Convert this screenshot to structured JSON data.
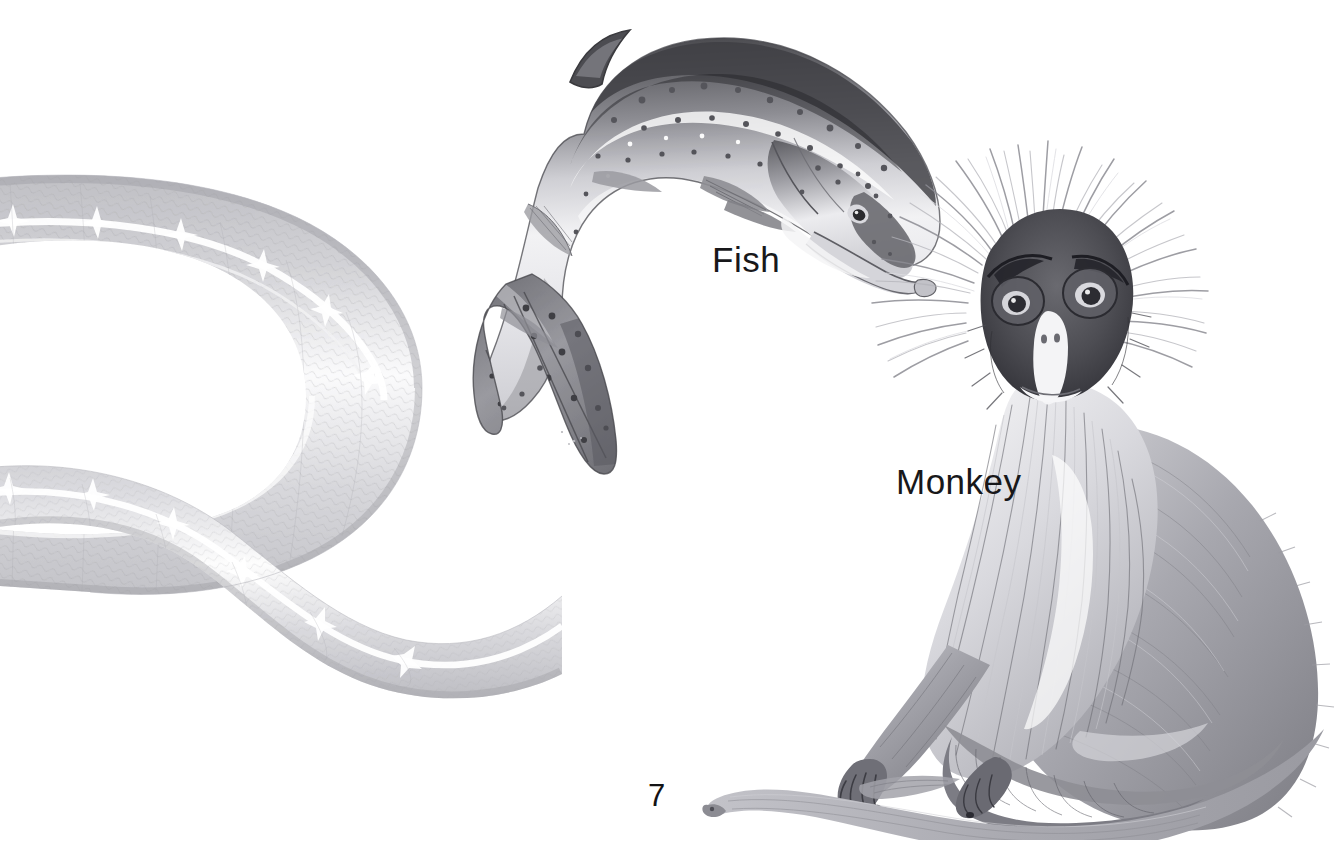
{
  "page": {
    "kind": "illustrated-book-page",
    "background_color": "#ffffff",
    "width": 1344,
    "height": 845,
    "page_number": "7"
  },
  "labels": {
    "fish": "Fish",
    "monkey": "Monkey"
  },
  "illustrations": [
    {
      "name": "snake",
      "subject": "snake",
      "labelled": false,
      "description": "Pale gray snake body curving in a wide U shape, cropped off the left edge of the page, with a white dorsal stripe and fine scale texture.",
      "position": "left",
      "tone": "light gray",
      "cropped_at_edge": "left"
    },
    {
      "name": "fish",
      "subject": "fish",
      "labelled": true,
      "label": "Fish",
      "description": "Leaping salmon arched head-down, dark speckled back, pale belly, hooked lower jaw, heavily spotted tail fin.",
      "position": "top-center",
      "tone": "mid gray"
    },
    {
      "name": "monkey",
      "subject": "monkey",
      "labelled": true,
      "label": "Monkey",
      "description": "Seated monkey facing forward with radiating spiky head fur, dark face with pale muzzle, long tail sweeping across the bottom of the page.",
      "position": "right",
      "tone": "mid gray"
    }
  ],
  "colors": {
    "ink": "#18181a",
    "paper": "#ffffff",
    "art_dark": "#4a4a4d",
    "art_mid": "#8e8e92",
    "art_light": "#c9c9cd",
    "art_pale": "#e3e3e6"
  }
}
